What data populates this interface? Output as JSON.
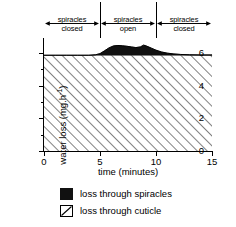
{
  "chart_data": {
    "type": "area",
    "title": "",
    "xlabel": "time (minutes)",
    "ylabel": "water loss (mg.h",
    "ylabel_sup": "-1",
    "ylabel_close": ")",
    "xlim": [
      0,
      15
    ],
    "ylim": [
      0,
      6.6
    ],
    "xticks": [
      0,
      5,
      10,
      15
    ],
    "xtick_labels": [
      "0",
      "5",
      "10",
      "15"
    ],
    "yticks": [
      0,
      2,
      4,
      6
    ],
    "ytick_labels": [
      "0",
      "2",
      "4",
      "6"
    ],
    "yticks_minor": [
      1,
      3,
      5
    ],
    "grid": false,
    "legend_position": "below",
    "series": [
      {
        "name": "loss through cuticle",
        "fill": "hatch",
        "baseline": 0,
        "values": [
          5.85,
          5.85,
          5.85,
          5.85,
          5.85,
          5.85,
          5.85,
          5.85,
          5.85,
          5.85,
          5.85,
          5.85,
          5.85,
          5.85,
          5.85,
          5.85
        ]
      },
      {
        "name": "loss through spiracles",
        "fill": "solid",
        "color": "#111111",
        "x": [
          0,
          1,
          2,
          3,
          4,
          4.6,
          5.0,
          5.4,
          5.8,
          6.2,
          6.6,
          7.0,
          7.4,
          7.8,
          8.2,
          8.6,
          8.9,
          9.2,
          9.6,
          10.0,
          10.5,
          11.0,
          11.6,
          12.2,
          13,
          14,
          15
        ],
        "values": [
          5.85,
          5.85,
          5.85,
          5.85,
          5.85,
          5.88,
          5.95,
          6.12,
          6.3,
          6.42,
          6.45,
          6.43,
          6.4,
          6.36,
          6.32,
          6.36,
          6.47,
          6.4,
          6.28,
          6.16,
          6.05,
          5.98,
          5.93,
          5.9,
          5.88,
          5.87,
          5.87
        ]
      }
    ]
  },
  "annotations": {
    "phases": [
      {
        "label_line1": "spiracles",
        "label_line2": "closed",
        "x_start": 0,
        "x_end": 5
      },
      {
        "label_line1": "spiracles",
        "label_line2": "open",
        "x_start": 5,
        "x_end": 10
      },
      {
        "label_line1": "spiracles",
        "label_line2": "closed",
        "x_start": 10,
        "x_end": 15
      }
    ],
    "separators": [
      5,
      10
    ]
  },
  "legend": {
    "items": [
      {
        "label": "loss through spiracles",
        "swatch": "solid-black-square"
      },
      {
        "label": "loss through cuticle",
        "swatch": "hatched-square"
      }
    ]
  }
}
